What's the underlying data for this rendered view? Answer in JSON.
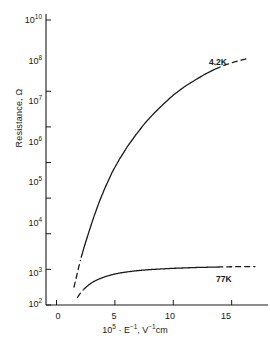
{
  "chart_data": {
    "type": "line",
    "title": "",
    "subtitle": "",
    "xlabel": "10⁵ · E⁻¹, V⁻¹cm",
    "ylabel": "Resistance, Ω",
    "xscale": "linear",
    "yscale": "log",
    "xlim": [
      -0.9,
      17.6
    ],
    "ylim": [
      100,
      10000000000
    ],
    "grid": false,
    "legend_position": "inline-curve-labels",
    "xticks": [
      0,
      5,
      10,
      15
    ],
    "xtick_labels": [
      "0",
      "5",
      "10",
      "15"
    ],
    "yticks": [
      100,
      1000,
      10000,
      100000,
      1000000,
      10000000,
      100000000,
      10000000000
    ],
    "ytick_labels": [
      "10",
      "10",
      "10",
      "10",
      "10",
      "10",
      "10",
      "10"
    ],
    "ytick_exponents": [
      "2",
      "3",
      "4",
      "5",
      "6",
      "7",
      "8",
      "10"
    ],
    "series": [
      {
        "name": "4.2K",
        "label": "4.2K",
        "color": "#1a1a1a",
        "x": [
          1.5,
          1.7,
          1.9,
          2.1,
          2.4,
          2.8,
          3.2,
          3.7,
          4.2,
          4.8,
          5.4,
          6.1,
          6.8,
          7.6,
          8.4,
          9.2,
          10.0,
          10.9,
          11.8,
          12.7,
          13.6,
          14.4,
          15.2,
          15.9,
          16.5
        ],
        "y": [
          320,
          600,
          1150,
          2100,
          4600,
          12000,
          30000,
          85000,
          210000,
          560000,
          1250000,
          2900000,
          6000000,
          13000000,
          25000000,
          45000000,
          78000000,
          130000000,
          200000000,
          300000000,
          420000000,
          540000000,
          660000000,
          760000000,
          850000000
        ],
        "dashed_start_x": [
          1.5,
          2.1
        ],
        "dashed_end_x": [
          13.6,
          16.5
        ]
      },
      {
        "name": "77K",
        "label": "77K",
        "color": "#1a1a1a",
        "x": [
          1.8,
          2.0,
          2.3,
          2.7,
          3.1,
          3.6,
          4.2,
          4.9,
          5.6,
          6.4,
          7.2,
          8.1,
          9.0,
          10.0,
          11.0,
          12.0,
          13.0,
          13.8,
          14.6,
          15.4,
          16.2,
          17.0
        ],
        "y": [
          165,
          205,
          270,
          355,
          440,
          530,
          630,
          730,
          810,
          880,
          940,
          990,
          1030,
          1070,
          1100,
          1130,
          1150,
          1165,
          1180,
          1190,
          1195,
          1200
        ],
        "dashed_start_x": [
          1.8,
          2.3
        ],
        "dashed_end_x": [
          13.8,
          17.0
        ]
      }
    ],
    "annotations": [
      {
        "text": "4.2K",
        "x": 14.0,
        "y": 100000000
      },
      {
        "text": "77K",
        "x": 14.2,
        "y": 560
      }
    ]
  },
  "axis": {
    "y_title": "Resistance, Ω",
    "x_title_prefix": "10",
    "x_title_exp": "5",
    "x_title_mid": " · E",
    "x_title_exp2": "−1",
    "x_title_tail": ", V",
    "x_title_exp3": "−1",
    "x_title_unit": "cm"
  },
  "curve_labels": {
    "cold": "4.2K",
    "warm": "77K"
  }
}
